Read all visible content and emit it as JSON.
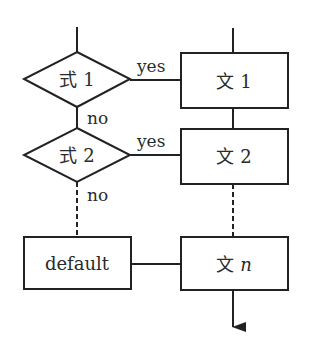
{
  "diagram": {
    "type": "flowchart",
    "conditions": [
      {
        "id": "cond1",
        "label": "式 1",
        "yes_label": "yes",
        "no_label": "no"
      },
      {
        "id": "cond2",
        "label": "式 2",
        "yes_label": "yes",
        "no_label": "no"
      }
    ],
    "statements": [
      {
        "id": "stmt1",
        "label": "文 1"
      },
      {
        "id": "stmt2",
        "label": "文 2"
      },
      {
        "id": "stmtn",
        "label_prefix": "文",
        "label_var": "n"
      }
    ],
    "default_box": {
      "label": "default"
    },
    "colors": {
      "stroke": "#222222",
      "background": "#ffffff",
      "text": "#2a2a2a"
    }
  }
}
